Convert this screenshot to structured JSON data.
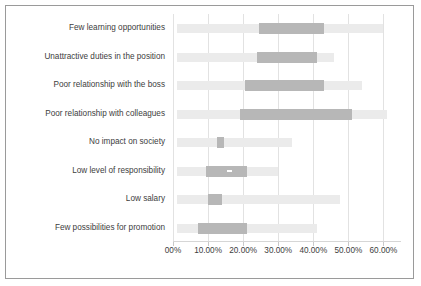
{
  "chart_data": {
    "type": "bar",
    "subtype": "box-plot-horizontal",
    "title": "",
    "subtitle": "",
    "xlabel": "",
    "ylabel": "",
    "xlim": [
      0,
      0.65
    ],
    "grid": true,
    "legend": null,
    "orientation": "horizontal",
    "tick_labels": [
      "00%",
      "10.00%",
      "20.00%",
      "30.00%",
      "40.00%",
      "50.00%",
      "60.00%"
    ],
    "tick_values": [
      0,
      10,
      20,
      30,
      40,
      50,
      60
    ],
    "categories": [
      "Few learning opportunities",
      "Unattractive duties in the position",
      "Poor relationship with the boss",
      "Poor relationship with colleagues",
      "No impact on society",
      "Low level of responsibility",
      "Low salary",
      "Few possibilities for promotion"
    ],
    "series": [
      {
        "name": "whisker_low",
        "values": [
          1.0,
          1.0,
          1.0,
          1.0,
          1.0,
          1.0,
          1.0,
          1.0
        ]
      },
      {
        "name": "box_low",
        "values": [
          24.5,
          24.0,
          20.5,
          19.0,
          12.5,
          9.5,
          10.0,
          7.0
        ]
      },
      {
        "name": "median",
        "values": [
          34.5,
          32.5,
          31.5,
          35.0,
          13.5,
          16.0,
          12.0,
          14.0
        ]
      },
      {
        "name": "box_high",
        "values": [
          43.0,
          41.0,
          43.0,
          51.0,
          14.5,
          21.0,
          14.0,
          21.0
        ]
      },
      {
        "name": "whisker_high",
        "values": [
          60.0,
          46.0,
          54.0,
          61.0,
          34.0,
          30.0,
          47.5,
          41.0
        ]
      }
    ],
    "colors": {
      "whisker": "#ebebeb",
      "box": "#b7b7b7",
      "median": "#ffffff",
      "grid": "#e2e2e2",
      "border": "#9a9a9a",
      "text": "#3d3d3d"
    }
  }
}
